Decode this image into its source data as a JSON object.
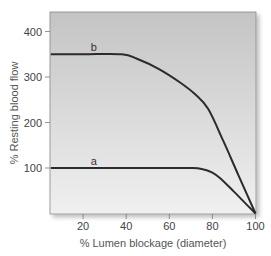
{
  "chart_data": {
    "type": "line",
    "title": "",
    "xlabel": "% Lumen blockage (diameter)",
    "ylabel": "% Resting blood flow",
    "xlim": [
      5,
      100
    ],
    "ylim": [
      0,
      440
    ],
    "x_ticks": [
      20,
      40,
      60,
      80,
      100
    ],
    "y_ticks": [
      100,
      200,
      300,
      400
    ],
    "grid": false,
    "legend": "inline curve labels",
    "series": [
      {
        "name": "b",
        "color": "#2b2b2b",
        "x": [
          5,
          20,
          38,
          45,
          55,
          65,
          72,
          78,
          85,
          92,
          100
        ],
        "y": [
          350,
          350,
          350,
          340,
          318,
          288,
          262,
          230,
          160,
          85,
          0
        ]
      },
      {
        "name": "a",
        "color": "#2b2b2b",
        "x": [
          5,
          20,
          40,
          60,
          70,
          75,
          80,
          84,
          90,
          95,
          100
        ],
        "y": [
          100,
          100,
          100,
          100,
          100,
          98,
          90,
          76,
          48,
          24,
          0
        ]
      }
    ],
    "annotations": [
      {
        "text": "b",
        "x": 25,
        "y": 365
      },
      {
        "text": "a",
        "x": 25,
        "y": 115
      }
    ]
  },
  "colors": {
    "plot_bg_top": "#c4c4c4",
    "plot_bg_bottom": "#f0f0f0",
    "line": "#2b2b2b",
    "axis": "#777777"
  }
}
